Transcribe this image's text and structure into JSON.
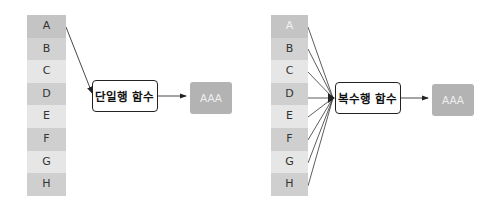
{
  "left_diagram": {
    "rows": [
      "A",
      "B",
      "C",
      "D",
      "E",
      "F",
      "G",
      "H"
    ],
    "row_colors": [
      "#c4c4c4",
      "#d2d2d2",
      "#e6e6e6",
      "#cfcfcf",
      "#e6e6e6",
      "#cfcfcf",
      "#e6e6e6",
      "#cfcfcf"
    ],
    "function_label": "단일행 함수",
    "result_label": "AAA"
  },
  "right_diagram": {
    "rows": [
      "A",
      "B",
      "C",
      "D",
      "E",
      "F",
      "G",
      "H"
    ],
    "row_colors": [
      "#c4c4c4",
      "#d2d2d2",
      "#e6e6e6",
      "#cfcfcf",
      "#e6e6e6",
      "#cfcfcf",
      "#e6e6e6",
      "#cfcfcf"
    ],
    "function_label": "복수행 함수",
    "result_label": "AAA"
  }
}
